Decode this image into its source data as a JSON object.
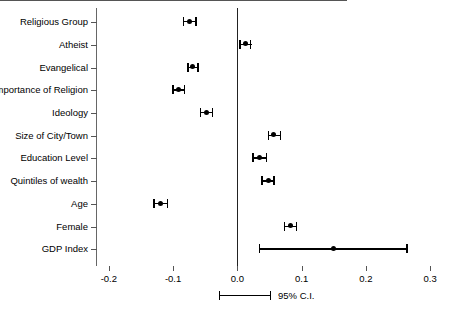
{
  "chart_data": {
    "type": "scatter",
    "title": "",
    "xlabel": "",
    "ylabel": "",
    "xlim": [
      -0.22,
      0.32
    ],
    "xticks": [
      -0.2,
      -0.1,
      0.0,
      0.1,
      0.2,
      0.3
    ],
    "xticklabels": [
      "-0.2",
      "-0.1",
      "0.0",
      "0.1",
      "0.2",
      "0.3"
    ],
    "grid": false,
    "reference_line": 0.0,
    "legend": {
      "position": "bottom-center",
      "label": "95% C.I."
    },
    "categories": [
      "Religious Group",
      "Atheist",
      "Evangelical",
      "Importance of Religion",
      "Ideology",
      "Size of City/Town",
      "Education Level",
      "Quintiles of wealth",
      "Age",
      "Female",
      "GDP Index"
    ],
    "estimates": [
      -0.075,
      0.012,
      -0.07,
      -0.091,
      -0.048,
      0.056,
      0.035,
      0.048,
      -0.12,
      0.083,
      0.15
    ],
    "ci_low": [
      -0.085,
      0.003,
      -0.078,
      -0.101,
      -0.058,
      0.047,
      0.023,
      0.037,
      -0.131,
      0.072,
      0.033
    ],
    "ci_high": [
      -0.063,
      0.022,
      -0.06,
      -0.081,
      -0.038,
      0.068,
      0.046,
      0.058,
      -0.108,
      0.093,
      0.265
    ],
    "points": [
      {
        "label": "Religious Group",
        "estimate": -0.075,
        "ci_low": -0.085,
        "ci_high": -0.063
      },
      {
        "label": "Atheist",
        "estimate": 0.012,
        "ci_low": 0.003,
        "ci_high": 0.022
      },
      {
        "label": "Evangelical",
        "estimate": -0.07,
        "ci_low": -0.078,
        "ci_high": -0.06
      },
      {
        "label": "Importance of Religion",
        "estimate": -0.091,
        "ci_low": -0.101,
        "ci_high": -0.081
      },
      {
        "label": "Ideology",
        "estimate": -0.048,
        "ci_low": -0.058,
        "ci_high": -0.038
      },
      {
        "label": "Size of City/Town",
        "estimate": 0.056,
        "ci_low": 0.047,
        "ci_high": 0.068
      },
      {
        "label": "Education Level",
        "estimate": 0.035,
        "ci_low": 0.023,
        "ci_high": 0.046
      },
      {
        "label": "Quintiles of wealth",
        "estimate": 0.048,
        "ci_low": 0.037,
        "ci_high": 0.058
      },
      {
        "label": "Age",
        "estimate": -0.12,
        "ci_low": -0.131,
        "ci_high": -0.108
      },
      {
        "label": "Female",
        "estimate": 0.083,
        "ci_low": 0.072,
        "ci_high": 0.093
      },
      {
        "label": "GDP Index",
        "estimate": 0.15,
        "ci_low": 0.033,
        "ci_high": 0.265
      }
    ],
    "colors": {
      "marker": "#000000",
      "line": "#000000",
      "axis": "#555555",
      "reference": "#222222"
    }
  },
  "legend": {
    "label": "95% C.I."
  }
}
